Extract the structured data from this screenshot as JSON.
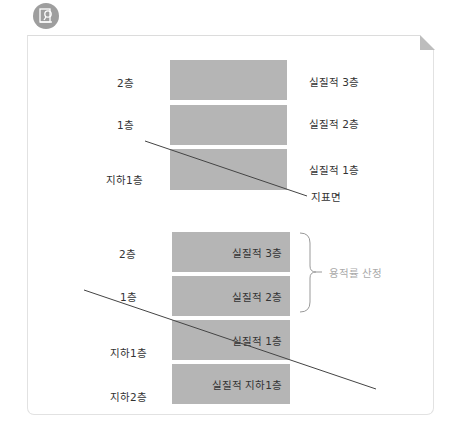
{
  "icon": {
    "name": "document-search-icon",
    "color": "#9e9e9e"
  },
  "top_diagram": {
    "floors_left": [
      "2층",
      "1층",
      "지하1층"
    ],
    "floors_right": [
      "실질적 3층",
      "실질적 2층",
      "실질적 1층"
    ],
    "ground_label": "지표면"
  },
  "bottom_diagram": {
    "floors_left": [
      "2층",
      "1층",
      "지하1층",
      "지하2층"
    ],
    "box_labels": [
      "실질적 3층",
      "실질적 2층",
      "실질적 1층",
      "실질적 지하1층"
    ],
    "brace_label": "용적률 산정"
  },
  "colors": {
    "box": "#b5b5b5",
    "line": "#444444",
    "brace": "#999999",
    "border": "#e2e2e2"
  }
}
